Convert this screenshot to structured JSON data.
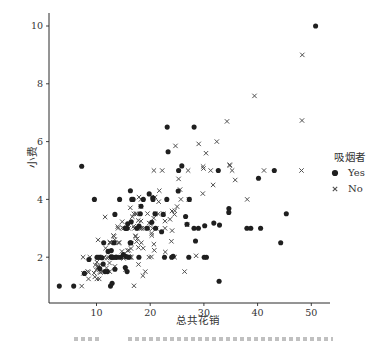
{
  "chart_data": {
    "type": "scatter",
    "title": "",
    "xlabel": "总共花销",
    "ylabel": "小费",
    "legend_title": "吸烟者",
    "legend_position": "right-outside",
    "grid": false,
    "xticks": [
      10,
      20,
      30,
      40,
      50
    ],
    "yticks": [
      2,
      4,
      6,
      8,
      10
    ],
    "xlim": [
      1.2,
      53.6
    ],
    "ylim": [
      0.4,
      10.45
    ],
    "colors": {
      "axis": "#2b2b2b",
      "text": "#333333",
      "dot": "#1f1f1f",
      "cross": "#4f4f4f"
    },
    "series": [
      {
        "name": "Yes",
        "marker": "circle",
        "color": "#1f1f1f",
        "points": [
          [
            38.01,
            3.0
          ],
          [
            11.24,
            1.76
          ],
          [
            20.29,
            3.21
          ],
          [
            13.81,
            2.0
          ],
          [
            11.02,
            1.98
          ],
          [
            18.29,
            3.76
          ],
          [
            3.07,
            1.0
          ],
          [
            15.01,
            2.09
          ],
          [
            26.86,
            3.14
          ],
          [
            25.28,
            5.0
          ],
          [
            17.92,
            3.08
          ],
          [
            19.44,
            3.0
          ],
          [
            32.68,
            5.0
          ],
          [
            28.97,
            3.0
          ],
          [
            5.75,
            1.0
          ],
          [
            16.32,
            4.3
          ],
          [
            40.17,
            4.73
          ],
          [
            27.28,
            4.0
          ],
          [
            12.03,
            1.5
          ],
          [
            21.01,
            3.0
          ],
          [
            11.35,
            2.5
          ],
          [
            15.38,
            3.0
          ],
          [
            44.3,
            2.5
          ],
          [
            22.42,
            3.48
          ],
          [
            15.36,
            1.64
          ],
          [
            20.49,
            4.06
          ],
          [
            25.21,
            4.29
          ],
          [
            14.31,
            4.0
          ],
          [
            16.0,
            2.0
          ],
          [
            17.51,
            3.0
          ],
          [
            10.59,
            1.61
          ],
          [
            10.63,
            2.0
          ],
          [
            50.81,
            10.0
          ],
          [
            15.81,
            3.16
          ],
          [
            7.25,
            5.15
          ],
          [
            31.85,
            3.18
          ],
          [
            16.82,
            4.0
          ],
          [
            32.9,
            3.11
          ],
          [
            17.89,
            2.0
          ],
          [
            14.48,
            2.0
          ],
          [
            9.6,
            4.0
          ],
          [
            34.63,
            3.55
          ],
          [
            34.65,
            3.68
          ],
          [
            23.33,
            5.65
          ],
          [
            45.35,
            3.5
          ],
          [
            23.17,
            6.5
          ],
          [
            40.55,
            3.0
          ],
          [
            20.9,
            3.5
          ],
          [
            30.46,
            2.0
          ],
          [
            18.15,
            3.5
          ],
          [
            23.1,
            4.0
          ],
          [
            15.69,
            1.5
          ],
          [
            19.81,
            4.19
          ],
          [
            28.44,
            2.56
          ],
          [
            15.48,
            2.02
          ],
          [
            16.58,
            4.0
          ],
          [
            10.34,
            2.0
          ],
          [
            43.11,
            5.0
          ],
          [
            13.0,
            2.0
          ],
          [
            13.51,
            2.0
          ],
          [
            18.71,
            4.0
          ],
          [
            12.74,
            2.01
          ],
          [
            13.0,
            2.0
          ],
          [
            16.4,
            2.5
          ],
          [
            20.53,
            4.0
          ],
          [
            16.47,
            3.23
          ],
          [
            26.59,
            3.41
          ],
          [
            38.73,
            3.0
          ],
          [
            24.27,
            2.03
          ],
          [
            12.76,
            2.23
          ],
          [
            30.06,
            2.0
          ],
          [
            25.89,
            5.16
          ],
          [
            13.27,
            2.5
          ],
          [
            28.17,
            6.5
          ],
          [
            12.9,
            1.1
          ],
          [
            28.15,
            3.0
          ],
          [
            11.59,
            1.5
          ],
          [
            7.74,
            1.44
          ],
          [
            30.14,
            3.09
          ],
          [
            12.16,
            2.2
          ],
          [
            13.42,
            3.48
          ],
          [
            8.58,
            1.92
          ],
          [
            13.42,
            1.58
          ],
          [
            16.27,
            2.5
          ],
          [
            10.09,
            2.0
          ],
          [
            22.12,
            2.88
          ],
          [
            24.01,
            2.0
          ],
          [
            15.69,
            3.0
          ],
          [
            15.53,
            3.0
          ],
          [
            12.6,
            1.0
          ],
          [
            32.83,
            1.17
          ],
          [
            27.18,
            2.0
          ],
          [
            22.67,
            2.0
          ]
        ]
      },
      {
        "name": "No",
        "marker": "x",
        "color": "#4f4f4f",
        "points": [
          [
            16.99,
            1.01
          ],
          [
            10.34,
            1.66
          ],
          [
            21.01,
            3.5
          ],
          [
            23.68,
            3.31
          ],
          [
            24.59,
            3.61
          ],
          [
            25.29,
            4.71
          ],
          [
            8.77,
            2.0
          ],
          [
            26.88,
            3.12
          ],
          [
            15.04,
            1.96
          ],
          [
            14.78,
            3.23
          ],
          [
            10.27,
            1.71
          ],
          [
            35.26,
            5.0
          ],
          [
            15.42,
            1.57
          ],
          [
            18.43,
            3.0
          ],
          [
            14.83,
            3.02
          ],
          [
            21.58,
            3.92
          ],
          [
            10.33,
            1.67
          ],
          [
            16.29,
            3.71
          ],
          [
            16.97,
            3.5
          ],
          [
            20.65,
            3.35
          ],
          [
            17.92,
            4.08
          ],
          [
            20.29,
            2.75
          ],
          [
            15.77,
            2.23
          ],
          [
            39.42,
            7.58
          ],
          [
            19.82,
            3.18
          ],
          [
            17.81,
            2.34
          ],
          [
            13.37,
            2.0
          ],
          [
            12.69,
            2.0
          ],
          [
            21.7,
            4.3
          ],
          [
            19.65,
            3.0
          ],
          [
            9.55,
            1.45
          ],
          [
            18.35,
            2.5
          ],
          [
            15.06,
            3.0
          ],
          [
            20.69,
            2.45
          ],
          [
            17.78,
            3.27
          ],
          [
            24.06,
            3.6
          ],
          [
            16.31,
            2.0
          ],
          [
            16.93,
            3.07
          ],
          [
            18.69,
            2.31
          ],
          [
            31.27,
            5.0
          ],
          [
            16.04,
            2.24
          ],
          [
            17.46,
            2.54
          ],
          [
            13.94,
            3.06
          ],
          [
            9.68,
            1.32
          ],
          [
            30.4,
            5.6
          ],
          [
            18.29,
            3.0
          ],
          [
            22.23,
            5.0
          ],
          [
            32.4,
            6.0
          ],
          [
            28.55,
            2.05
          ],
          [
            18.04,
            3.0
          ],
          [
            12.54,
            2.5
          ],
          [
            10.29,
            2.6
          ],
          [
            34.81,
            5.2
          ],
          [
            9.94,
            1.56
          ],
          [
            25.56,
            4.34
          ],
          [
            19.49,
            3.51
          ],
          [
            26.41,
            1.5
          ],
          [
            48.27,
            6.73
          ],
          [
            17.59,
            2.64
          ],
          [
            20.08,
            3.15
          ],
          [
            16.45,
            2.47
          ],
          [
            20.23,
            2.01
          ],
          [
            12.02,
            1.97
          ],
          [
            17.07,
            3.0
          ],
          [
            14.73,
            2.2
          ],
          [
            10.51,
            1.25
          ],
          [
            27.2,
            4.0
          ],
          [
            22.76,
            3.0
          ],
          [
            17.29,
            2.71
          ],
          [
            16.66,
            3.4
          ],
          [
            10.07,
            1.83
          ],
          [
            15.98,
            2.03
          ],
          [
            34.83,
            5.17
          ],
          [
            13.03,
            2.0
          ],
          [
            18.28,
            4.0
          ],
          [
            24.71,
            5.85
          ],
          [
            21.16,
            3.0
          ],
          [
            22.49,
            3.5
          ],
          [
            22.75,
            3.25
          ],
          [
            12.46,
            1.5
          ],
          [
            20.92,
            4.08
          ],
          [
            18.24,
            3.76
          ],
          [
            14.0,
            3.0
          ],
          [
            7.25,
            1.0
          ],
          [
            38.07,
            4.0
          ],
          [
            23.95,
            2.55
          ],
          [
            25.71,
            4.0
          ],
          [
            17.31,
            3.5
          ],
          [
            29.93,
            5.07
          ],
          [
            10.65,
            1.5
          ],
          [
            12.43,
            1.8
          ],
          [
            24.08,
            2.92
          ],
          [
            11.69,
            2.31
          ],
          [
            13.42,
            1.68
          ],
          [
            14.26,
            2.5
          ],
          [
            15.95,
            2.0
          ],
          [
            12.48,
            2.52
          ],
          [
            29.8,
            4.2
          ],
          [
            8.52,
            1.48
          ],
          [
            14.52,
            2.0
          ],
          [
            11.38,
            2.0
          ],
          [
            22.82,
            2.18
          ],
          [
            19.08,
            1.5
          ],
          [
            20.27,
            2.83
          ],
          [
            11.17,
            1.5
          ],
          [
            12.26,
            2.0
          ],
          [
            18.26,
            3.25
          ],
          [
            8.51,
            1.25
          ],
          [
            10.33,
            2.0
          ],
          [
            14.15,
            2.0
          ],
          [
            13.16,
            2.75
          ],
          [
            17.47,
            3.5
          ],
          [
            34.3,
            6.7
          ],
          [
            41.19,
            5.0
          ],
          [
            27.05,
            5.0
          ],
          [
            16.43,
            2.3
          ],
          [
            8.35,
            1.5
          ],
          [
            18.64,
            1.36
          ],
          [
            11.87,
            1.63
          ],
          [
            9.78,
            1.73
          ],
          [
            7.51,
            2.0
          ],
          [
            14.07,
            2.5
          ],
          [
            13.13,
            2.0
          ],
          [
            17.26,
            2.74
          ],
          [
            24.55,
            2.0
          ],
          [
            19.77,
            2.0
          ],
          [
            29.85,
            5.14
          ],
          [
            48.17,
            5.0
          ],
          [
            25.0,
            3.75
          ],
          [
            13.39,
            2.61
          ],
          [
            16.49,
            2.0
          ],
          [
            21.5,
            3.5
          ],
          [
            12.66,
            2.5
          ],
          [
            16.21,
            2.0
          ],
          [
            13.81,
            2.0
          ],
          [
            24.52,
            3.48
          ],
          [
            20.76,
            2.24
          ],
          [
            31.71,
            4.5
          ],
          [
            20.69,
            5.0
          ],
          [
            7.56,
            1.44
          ],
          [
            48.33,
            9.0
          ],
          [
            15.98,
            3.0
          ],
          [
            20.45,
            3.0
          ],
          [
            13.28,
            2.72
          ],
          [
            11.61,
            3.39
          ],
          [
            10.77,
            1.47
          ],
          [
            10.07,
            1.25
          ],
          [
            35.83,
            4.67
          ],
          [
            29.03,
            5.92
          ],
          [
            17.82,
            1.75
          ],
          [
            18.78,
            3.0
          ]
        ]
      }
    ]
  }
}
